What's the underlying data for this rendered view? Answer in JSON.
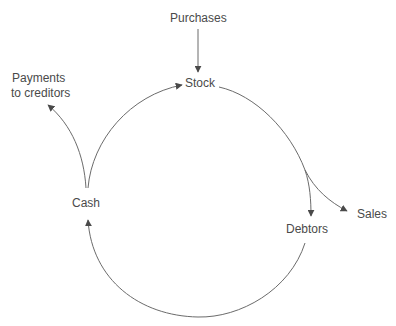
{
  "diagram": {
    "title": "",
    "nodes": {
      "purchases": "Purchases",
      "stock": "Stock",
      "sales": "Sales",
      "debtors": "Debtors",
      "cash": "Cash",
      "payments_line1": "Payments",
      "payments_line2": "to creditors"
    },
    "edges": [
      {
        "from": "Purchases",
        "to": "Stock"
      },
      {
        "from": "Stock",
        "to": "Debtors"
      },
      {
        "from": "Stock",
        "to": "Sales"
      },
      {
        "from": "Debtors",
        "to": "Cash"
      },
      {
        "from": "Cash",
        "to": "Stock"
      },
      {
        "from": "Cash",
        "to": "Payments to creditors"
      }
    ],
    "colors": {
      "line": "#6b6b6b",
      "text": "#4a4a4a",
      "background": "#ffffff"
    }
  }
}
